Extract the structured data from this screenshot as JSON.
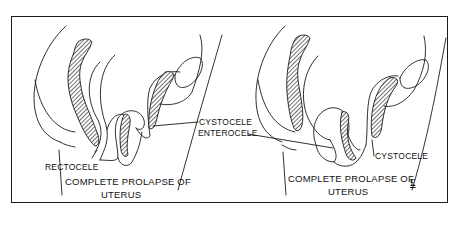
{
  "figure": {
    "panels": [
      {
        "id": "left",
        "caption_line1": "COMPLETE PROLAPSE OF",
        "caption_line2": "UTERUS",
        "labels": [
          "RECTOCELE"
        ]
      },
      {
        "id": "right",
        "caption_line1": "COMPLETE PROLAPSE OF",
        "caption_line2": "UTERUS",
        "labels": [
          "CYSTOCELE"
        ]
      }
    ],
    "shared_labels": {
      "cystocele": "CYSTOCELE",
      "enterocele": "ENTEROCELE"
    },
    "signature_mark": "£"
  },
  "colors": {
    "ink": "#1a1a1a",
    "background": "#ffffff"
  }
}
